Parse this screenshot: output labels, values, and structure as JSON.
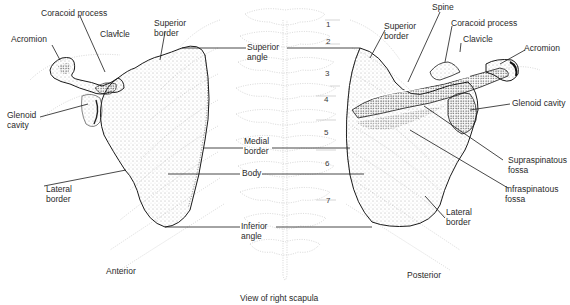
{
  "diagram": {
    "caption": "View of right scapula",
    "views": {
      "anterior": "Anterior",
      "posterior": "Posterior"
    },
    "anterior_labels": {
      "coracoid_process": "Coracoid process",
      "acromion": "Acromion",
      "clavicle": "Clavicle",
      "superior_border_1": "Superior",
      "superior_border_2": "border",
      "glenoid_cavity_1": "Glenoid",
      "glenoid_cavity_2": "cavity",
      "lateral_border_1": "Lateral",
      "lateral_border_2": "border"
    },
    "center_labels": {
      "superior_angle_1": "Superior",
      "superior_angle_2": "angle",
      "medial_border_1": "Medial",
      "medial_border_2": "border",
      "body": "Body",
      "inferior_angle_1": "Inferior",
      "inferior_angle_2": "angle"
    },
    "posterior_labels": {
      "spine": "Spine",
      "superior_border_1": "Superior",
      "superior_border_2": "border",
      "coracoid_process": "Coracoid process",
      "clavicle": "Clavicle",
      "acromion": "Acromion",
      "glenoid_cavity": "Glenoid cavity",
      "supraspinatous_fossa_1": "Supraspinatous",
      "supraspinatous_fossa_2": "fossa",
      "infraspinatous_fossa_1": "Infraspinatous",
      "infraspinatous_fossa_2": "fossa",
      "lateral_border_1": "Lateral",
      "lateral_border_2": "border"
    },
    "rib_numbers": [
      "1",
      "2",
      "3",
      "4",
      "5",
      "6",
      "7"
    ],
    "colors": {
      "ink": "#1a1a1a",
      "stipple": "#555555",
      "faint": "#bdbdbd",
      "background": "#ffffff"
    }
  }
}
